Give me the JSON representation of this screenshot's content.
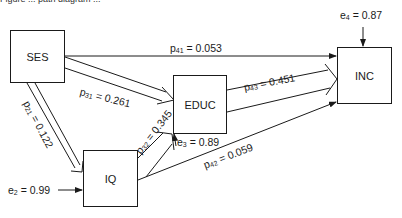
{
  "caption": "Figure ... path diagram ...",
  "nodes": {
    "ses": "SES",
    "educ": "EDUC",
    "inc": "INC",
    "iq": "IQ"
  },
  "paths": {
    "p41": {
      "name": "p",
      "sub": "41",
      "value": "= 0.053",
      "from": "SES",
      "to": "INC"
    },
    "p31": {
      "name": "p",
      "sub": "31",
      "value": "= 0.261",
      "from": "SES",
      "to": "EDUC"
    },
    "p21": {
      "name": "p",
      "sub": "21",
      "value": "= 0.122",
      "from": "SES",
      "to": "IQ"
    },
    "p32": {
      "name": "p",
      "sub": "32",
      "value": "= 0.345",
      "from": "IQ",
      "to": "EDUC"
    },
    "p43": {
      "name": "p",
      "sub": "43",
      "value": "= 0.451",
      "from": "EDUC",
      "to": "INC"
    },
    "p42": {
      "name": "p",
      "sub": "42",
      "value": "= 0.059",
      "from": "IQ",
      "to": "INC"
    }
  },
  "errors": {
    "e2": {
      "name": "e",
      "sub": "2",
      "value": "= 0.99",
      "target": "IQ"
    },
    "e3": {
      "name": "e",
      "sub": "3",
      "value": "= 0.89",
      "target": "EDUC"
    },
    "e4": {
      "name": "e",
      "sub": "4",
      "value": "= 0.87",
      "target": "INC"
    }
  },
  "colors": {
    "ink": "#1a1a1a",
    "background": "#ffffff"
  }
}
